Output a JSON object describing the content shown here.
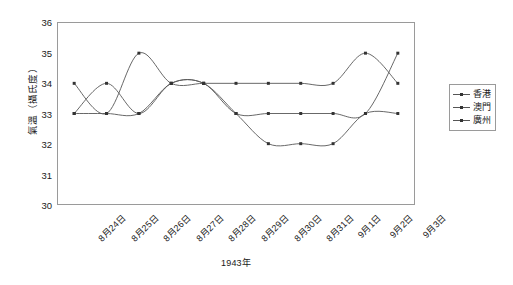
{
  "chart_data": {
    "type": "line",
    "title": "",
    "xlabel": "1943年",
    "ylabel": "氣溫（攝氏度）",
    "ylim": [
      30,
      36
    ],
    "yticks": [
      36,
      35,
      34,
      33,
      32,
      31,
      30
    ],
    "grid": false,
    "legend_position": "right",
    "categories": [
      "8月24日",
      "8月25日",
      "8月26日",
      "8月27日",
      "8月28日",
      "8月29日",
      "8月30日",
      "8月31日",
      "9月1日",
      "9月2日",
      "9月3日"
    ],
    "series": [
      {
        "name": "香港",
        "color": "#555555",
        "marker": "square",
        "values": [
          34,
          33,
          35,
          34,
          34,
          34,
          34,
          34,
          34,
          35,
          34
        ]
      },
      {
        "name": "澳門",
        "color": "#555555",
        "marker": "square",
        "values": [
          33,
          34,
          33,
          34,
          34,
          33,
          32,
          32,
          32,
          33,
          33
        ]
      },
      {
        "name": "廣州",
        "color": "#555555",
        "marker": "square",
        "values": [
          33,
          33,
          33,
          34,
          34,
          33,
          33,
          33,
          33,
          33,
          35
        ]
      }
    ]
  },
  "legend": {
    "items": [
      {
        "label": "香港"
      },
      {
        "label": "澳門"
      },
      {
        "label": "廣州"
      }
    ]
  },
  "axes": {
    "y_title": "氣溫（攝氏度）",
    "x_title": "1943年",
    "y_tick_labels": [
      "36",
      "35",
      "34",
      "33",
      "32",
      "31",
      "30"
    ],
    "x_tick_labels": [
      "8月24日",
      "8月25日",
      "8月26日",
      "8月27日",
      "8月28日",
      "8月29日",
      "8月30日",
      "8月31日",
      "9月1日",
      "9月2日",
      "9月3日"
    ]
  },
  "style": {
    "line_color": "#555555",
    "marker_color": "#333333",
    "frame_color": "#9a9a9a",
    "text_color": "#1a1a1a",
    "background": "#ffffff"
  }
}
